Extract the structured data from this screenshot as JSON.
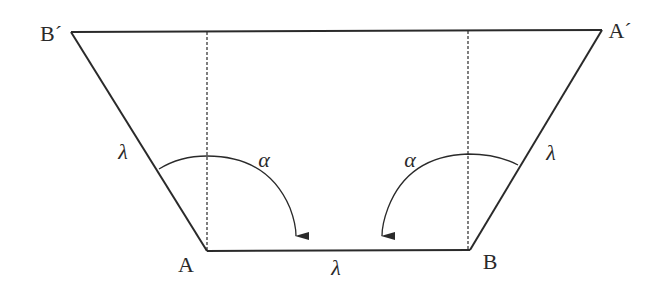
{
  "diagram": {
    "type": "trapezoid-geometry",
    "colors": {
      "stroke": "#2a2a2a",
      "background": "#ffffff"
    },
    "points": {
      "A": {
        "label": "A",
        "x": 207,
        "y": 251
      },
      "B": {
        "label": "B",
        "x": 470,
        "y": 250
      },
      "A_prime": {
        "label": "A′",
        "x": 602,
        "y": 30
      },
      "B_prime": {
        "label": "B′",
        "x": 71,
        "y": 32
      }
    },
    "labels": {
      "A": "A",
      "B": "B",
      "A_prime": "A´",
      "B_prime": "B´",
      "lambda_left": "λ",
      "lambda_right": "λ",
      "lambda_bottom": "λ",
      "alpha_left": "α",
      "alpha_right": "α"
    },
    "segments": [
      {
        "name": "top-edge",
        "from": "B_prime",
        "to": "A_prime",
        "style": "solid"
      },
      {
        "name": "left-edge",
        "from": "B_prime",
        "to": "A",
        "style": "solid",
        "length_label": "λ"
      },
      {
        "name": "bottom-edge",
        "from": "A",
        "to": "B",
        "style": "solid",
        "length_label": "λ"
      },
      {
        "name": "right-edge",
        "from": "B",
        "to": "A_prime",
        "style": "solid",
        "length_label": "λ"
      },
      {
        "name": "left-vertical",
        "x": 207,
        "style": "dashed"
      },
      {
        "name": "right-vertical",
        "x": 468,
        "style": "dashed"
      }
    ],
    "angles": [
      {
        "name": "alpha-left",
        "vertex": "A",
        "label": "α",
        "arrow": true
      },
      {
        "name": "alpha-right",
        "vertex": "B",
        "label": "α",
        "arrow": true
      }
    ]
  }
}
